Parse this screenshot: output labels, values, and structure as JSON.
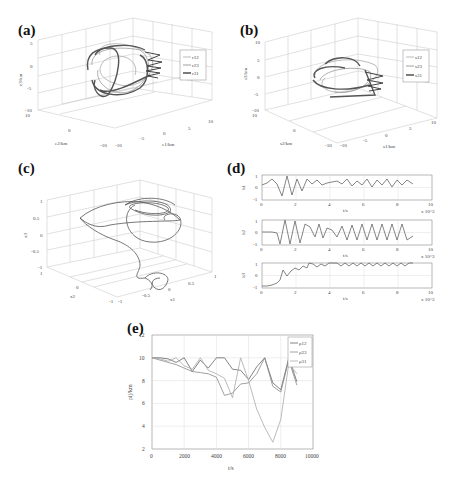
{
  "figure": {
    "panels": [
      "(a)",
      "(b)",
      "(c)",
      "(d)",
      "(e)"
    ]
  },
  "chart_data": [
    {
      "panel": "(a)",
      "type": "line",
      "subtype": "3d-trajectory",
      "xlabel": "e1/km",
      "ylabel": "e2/km",
      "zlabel": "e3/km",
      "x_ticks": [
        "-10",
        "-5",
        "0",
        "5",
        "10"
      ],
      "y_ticks": [
        "-10",
        "0",
        "10"
      ],
      "z_ticks": [
        "-10",
        "-5",
        "0",
        "5"
      ],
      "legend": [
        "r12",
        "r23",
        "r31"
      ],
      "legend_position": "right"
    },
    {
      "panel": "(b)",
      "type": "line",
      "subtype": "3d-trajectory",
      "xlabel": "s1/km",
      "ylabel": "s2/km",
      "zlabel": "s3/km",
      "x_ticks": [
        "-10",
        "-5",
        "0",
        "5",
        "10"
      ],
      "y_ticks": [
        "-10",
        "0",
        "10"
      ],
      "z_ticks": [
        "-10",
        "-5",
        "0",
        "5",
        "10"
      ],
      "legend": [
        "s12",
        "s23",
        "s31"
      ],
      "legend_position": "right"
    },
    {
      "panel": "(c)",
      "type": "line",
      "subtype": "3d-trajectory",
      "xlabel": "x1",
      "ylabel": "x2",
      "zlabel": "x3",
      "x_ticks": [
        "-1",
        "-0.5",
        "0",
        "0.5",
        "1"
      ],
      "y_ticks": [
        "-1",
        "0",
        "1"
      ],
      "z_ticks": [
        "-1",
        "-0.5",
        "0",
        "0.5",
        "1"
      ]
    },
    {
      "panel": "(d)",
      "type": "line",
      "subplots": [
        {
          "ylabel": "h1",
          "xlabel": "t/s",
          "x_multiplier": "x 10^3",
          "x_ticks": [
            "0",
            "2",
            "4",
            "6",
            "8",
            "10"
          ],
          "y_ticks": [
            "-1",
            "0",
            "1"
          ],
          "x": [
            0,
            0.3,
            0.6,
            0.9,
            1.2,
            1.5,
            1.8,
            2.1,
            2.4,
            2.7,
            3.0,
            3.3,
            3.6,
            3.9,
            4.2,
            4.5,
            4.8,
            5.1,
            5.4,
            5.7,
            6.0,
            6.3,
            6.6,
            6.9,
            7.2,
            7.5,
            7.8,
            8.1,
            8.4,
            8.7,
            9.0
          ],
          "values": [
            0.2,
            0.4,
            0.6,
            0.3,
            -0.7,
            1.0,
            -0.6,
            0.9,
            -0.3,
            0.8,
            0.2,
            0.7,
            0.3,
            0.4,
            0.2,
            0.5,
            0.3,
            0.7,
            0.2,
            0.6,
            0.3,
            0.7,
            0.1,
            0.6,
            0.2,
            0.7,
            0.1,
            0.6,
            0.2,
            0.6,
            0.3
          ]
        },
        {
          "ylabel": "h2",
          "xlabel": "t/s",
          "x_multiplier": "x 10^3",
          "x_ticks": [
            "0",
            "2",
            "4",
            "6",
            "8",
            "10"
          ],
          "y_ticks": [
            "-1",
            "0",
            "1"
          ],
          "x": [
            0,
            0.3,
            0.6,
            0.9,
            1.2,
            1.5,
            1.8,
            2.1,
            2.4,
            2.7,
            3.0,
            3.3,
            3.6,
            3.9,
            4.2,
            4.5,
            4.8,
            5.1,
            5.4,
            5.7,
            6.0,
            6.3,
            6.6,
            6.9,
            7.2,
            7.5,
            7.8,
            8.1,
            8.4,
            8.7,
            9.0
          ],
          "values": [
            0,
            0,
            0,
            -0.9,
            1.0,
            -0.9,
            0.9,
            -0.8,
            0.7,
            0.2,
            0.6,
            -0.3,
            0.8,
            -0.2,
            0.2,
            0.4,
            -0.3,
            0.6,
            -0.4,
            0.7,
            -0.4,
            0.7,
            -0.4,
            0.7,
            -0.3,
            0.6,
            -0.4,
            0.7,
            -0.3,
            0.6,
            -0.2
          ]
        },
        {
          "ylabel": "h3",
          "xlabel": "t/s",
          "x_multiplier": "x 10^3",
          "x_ticks": [
            "0",
            "2",
            "4",
            "6",
            "8",
            "10"
          ],
          "y_ticks": [
            "-1",
            "0",
            "1"
          ],
          "x": [
            0,
            0.3,
            0.6,
            0.9,
            1.2,
            1.5,
            1.8,
            2.1,
            2.4,
            2.7,
            3.0,
            3.3,
            3.6,
            3.9,
            4.2,
            4.5,
            4.8,
            5.1,
            5.4,
            5.7,
            6.0,
            6.3,
            6.6,
            6.9,
            7.2,
            7.5,
            7.8,
            8.1,
            8.4,
            8.7,
            9.0
          ],
          "values": [
            -0.9,
            -0.9,
            -0.8,
            -0.6,
            0.6,
            0.2,
            0.8,
            0.6,
            0.9,
            0.5,
            1.0,
            0.8,
            1.0,
            0.8,
            1.0,
            1.0,
            0.8,
            1.0,
            0.8,
            1.0,
            0.8,
            1.0,
            0.8,
            1.0,
            0.8,
            1.0,
            0.8,
            1.0,
            0.7,
            1.0,
            1.0
          ]
        }
      ]
    },
    {
      "panel": "(e)",
      "type": "line",
      "title": "",
      "xlabel": "t/s",
      "ylabel": "ρij/km",
      "xlim": [
        0,
        10000
      ],
      "ylim": [
        2,
        12
      ],
      "x_ticks": [
        "0",
        "2000",
        "4000",
        "6000",
        "8000",
        "10000"
      ],
      "y_ticks": [
        "2",
        "4",
        "6",
        "8",
        "10",
        "12"
      ],
      "grid": true,
      "legend_position": "upper right",
      "x": [
        0,
        500,
        1000,
        1500,
        2000,
        2500,
        3000,
        3500,
        4000,
        4500,
        5000,
        5500,
        6000,
        6500,
        7000,
        7500,
        8000,
        8500,
        9000
      ],
      "series": [
        {
          "name": "ρ12",
          "color": "#666666",
          "values": [
            10,
            10,
            9.9,
            9.6,
            10,
            8.8,
            9.8,
            9.1,
            10,
            10,
            9.0,
            8.9,
            8.1,
            9.2,
            10,
            7.8,
            7.2,
            10,
            7.9
          ]
        },
        {
          "name": "ρ23",
          "color": "#888888",
          "values": [
            10,
            9.8,
            9.6,
            9.4,
            9.1,
            8.8,
            8.7,
            8.6,
            8.3,
            6.7,
            6.9,
            7.7,
            7.8,
            8.6,
            10,
            7.5,
            7.0,
            9.8,
            7.6
          ]
        },
        {
          "name": "ρ31",
          "color": "#aaaaaa",
          "values": [
            10,
            9.9,
            9.7,
            10,
            9.3,
            9.0,
            10,
            8.9,
            8.6,
            8.2,
            6.5,
            10,
            8.0,
            5.5,
            3.9,
            2.6,
            4.6,
            9.5,
            8.6
          ]
        }
      ]
    }
  ]
}
